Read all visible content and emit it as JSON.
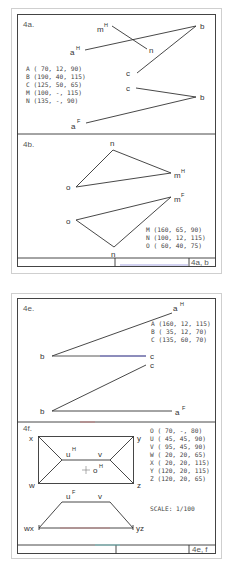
{
  "sheet1": {
    "tag": "4a, b",
    "panels": {
      "a": {
        "title": "4a.",
        "labels": {
          "aH": "a",
          "aH_sup": "H",
          "mH": "m",
          "mH_sup": "H",
          "n": "n",
          "bH": "b",
          "cH": "c",
          "cF": "c",
          "bF": "b",
          "aF": "a",
          "aF_sup": "F"
        },
        "coords": [
          "A ( 70, 12,  90)",
          "B (190, 40, 115)",
          "C (125, 50,  65)",
          "M (100,  -, 115)",
          "N (135,  -,  90)"
        ]
      },
      "b": {
        "title": "4b.",
        "labels": {
          "nH": "n",
          "mH": "m",
          "mH_sup": "H",
          "oH": "o",
          "mF": "m",
          "mF_sup": "F",
          "oF": "o",
          "nF": "n"
        },
        "coords": [
          "M (160, 65,  90)",
          "N (100, 12, 115)",
          "O ( 60, 40,  75)"
        ]
      }
    }
  },
  "sheet2": {
    "tag": "4e, f",
    "panels": {
      "e": {
        "title": "4e.",
        "labels": {
          "aH": "a",
          "aH_sup": "H",
          "bH": "b",
          "cH": "c",
          "cF": "c",
          "bF": "b",
          "aF": "a",
          "aF_sup": "F"
        },
        "coords": [
          "A (160, 12, 115)",
          "B ( 35, 12,  70)",
          "C (135, 60,  70)"
        ]
      },
      "f": {
        "title": "4f.",
        "labels": {
          "x": "x",
          "y": "y",
          "w": "w",
          "z": "z",
          "uH": "u",
          "uH_sup": "H",
          "vH": "v",
          "oH": "o",
          "oH_sup": "H",
          "uF": "u",
          "uF_sup": "F",
          "vF": "v",
          "wx": "wx",
          "yz": "yz"
        },
        "coords": [
          "O ( 70,  -,  80)",
          "U ( 45, 45,  90)",
          "V ( 95, 45,  90)",
          "W ( 20, 20,  65)",
          "X ( 20, 20, 115)",
          "Y (120, 20, 115)",
          "Z (120, 20,  65)"
        ],
        "scale": "SCALE: 1/100"
      }
    }
  },
  "colors": {
    "line": "#333333",
    "frame_outer": "#cfcfcf",
    "frame_inner": "#444444",
    "accent_blue": "#6a6ad0",
    "accent_red": "#d06a6a"
  }
}
